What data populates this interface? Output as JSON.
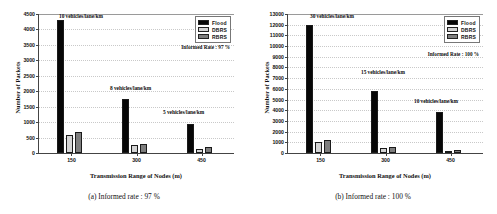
{
  "figure": {
    "width": 497,
    "height": 214,
    "background": "#ffffff"
  },
  "colors": {
    "flood": "#070707",
    "dbrs": "#d4d4d4",
    "rbrs": "#7e7e7e",
    "axis": "#444444",
    "grid": "#c9c9c9"
  },
  "panels": [
    {
      "id": "panel-a",
      "caption": "(a) Informed rate : 97 %",
      "rate_annotation": "Informed Rate : 97 %",
      "chart_data": {
        "type": "bar",
        "title": "",
        "xlabel": "Transmission Range of Nodes (m)",
        "ylabel": "Number of Packets",
        "categories": [
          "150",
          "300",
          "450"
        ],
        "ylim": [
          0,
          4500
        ],
        "yticks": [
          0,
          500,
          1000,
          1500,
          2000,
          2500,
          3000,
          3500,
          4000,
          4500
        ],
        "grid": true,
        "legend_position": "top-right",
        "series": [
          {
            "name": "Flood",
            "color": "#070707",
            "values": [
              4280,
              1740,
              930
            ]
          },
          {
            "name": "DBRS",
            "color": "#d4d4d4",
            "values": [
              570,
              260,
              140
            ]
          },
          {
            "name": "RBRS",
            "color": "#7e7e7e",
            "values": [
              670,
              305,
              180
            ]
          }
        ],
        "annotations": [
          {
            "text": "10 vehicles/lane/km",
            "category": "150"
          },
          {
            "text": "8 vehicles/lane/km",
            "category": "300"
          },
          {
            "text": "5 vehicles/lane/km",
            "category": "450"
          }
        ]
      }
    },
    {
      "id": "panel-b",
      "caption": "(b) Informed rate : 100 %",
      "rate_annotation": "Informed Rate : 100 %",
      "chart_data": {
        "type": "bar",
        "title": "",
        "xlabel": "Transmission Range of Nodes (m)",
        "ylabel": "Number of Packets",
        "categories": [
          "150",
          "300",
          "450"
        ],
        "ylim": [
          0,
          13000
        ],
        "yticks": [
          0,
          1000,
          2000,
          3000,
          4000,
          5000,
          6000,
          7000,
          8000,
          9000,
          10000,
          11000,
          12000,
          13000
        ],
        "grid": true,
        "legend_position": "top-right",
        "series": [
          {
            "name": "Flood",
            "color": "#070707",
            "values": [
              11900,
              5800,
              3850
            ]
          },
          {
            "name": "DBRS",
            "color": "#d4d4d4",
            "values": [
              1000,
              420,
              230
            ]
          },
          {
            "name": "RBRS",
            "color": "#7e7e7e",
            "values": [
              1180,
              580,
              300
            ]
          }
        ],
        "annotations": [
          {
            "text": "30 vehicles/lane/km",
            "category": "150"
          },
          {
            "text": "15 vehicles/lane/km",
            "category": "300"
          },
          {
            "text": "10 vehicles/lane/km",
            "category": "450"
          }
        ]
      }
    }
  ]
}
